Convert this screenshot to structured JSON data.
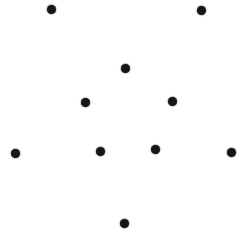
{
  "image": {
    "title": "Dot pattern",
    "width": 242,
    "height": 246,
    "background_color": "#ffffff",
    "dot_color": "#161616",
    "dot_count": 10,
    "arrangement": "symmetric diamond / cross of isolated round dots on a plain white field"
  },
  "chart_data": {
    "type": "scatter",
    "title": "",
    "subtitle": "",
    "xlabel": "",
    "ylabel": "",
    "xlim": [
      0,
      242
    ],
    "ylim": [
      0,
      246
    ],
    "grid": false,
    "axes_visible": false,
    "legend": null,
    "marker": {
      "shape": "circle",
      "color": "#161616",
      "diameter_px": 9
    },
    "points": [
      {
        "id": "top-left-outer",
        "x": 51,
        "y": 9,
        "d": 9
      },
      {
        "id": "top-right-outer",
        "x": 201,
        "y": 10,
        "d": 9
      },
      {
        "id": "top-center",
        "x": 125,
        "y": 68,
        "d": 9
      },
      {
        "id": "mid-upper-left",
        "x": 85,
        "y": 102,
        "d": 9
      },
      {
        "id": "mid-upper-right",
        "x": 172,
        "y": 101,
        "d": 9
      },
      {
        "id": "far-left",
        "x": 15,
        "y": 153,
        "d": 9
      },
      {
        "id": "mid-lower-left",
        "x": 100,
        "y": 151,
        "d": 9
      },
      {
        "id": "mid-lower-right",
        "x": 155,
        "y": 149,
        "d": 9
      },
      {
        "id": "far-right",
        "x": 231,
        "y": 152,
        "d": 9
      },
      {
        "id": "bottom-center",
        "x": 124,
        "y": 223,
        "d": 9
      }
    ]
  }
}
